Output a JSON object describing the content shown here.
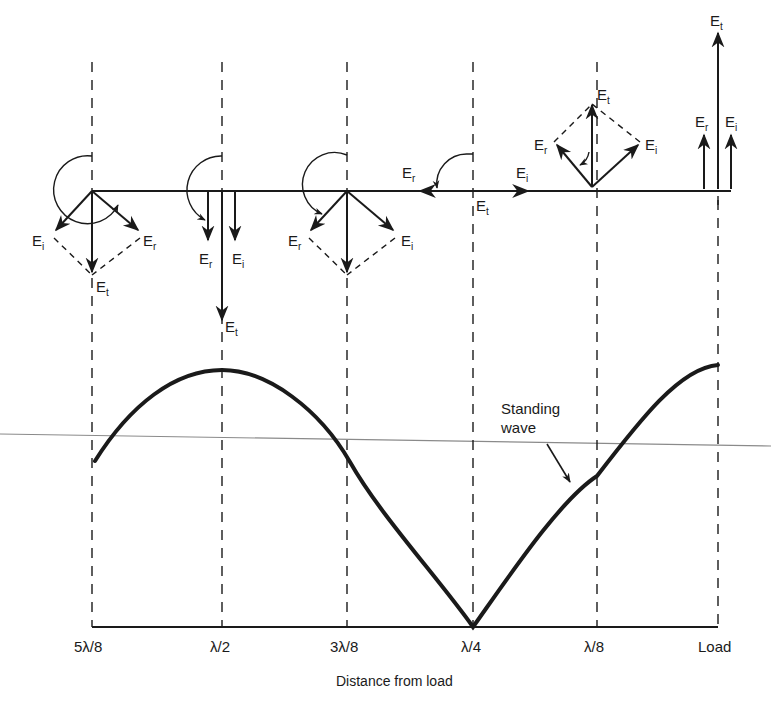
{
  "diagram": {
    "colors": {
      "ink": "#1a1a1a",
      "guide": "#8a8a8a",
      "background": "#ffffff"
    },
    "vector_labels": {
      "incident": "E",
      "incident_sub": "i",
      "reflected": "E",
      "reflected_sub": "r",
      "total": "E",
      "total_sub": "t"
    },
    "positions": [
      {
        "label": "5λ/8",
        "total_direction": "down"
      },
      {
        "label": "λ/2",
        "total_direction": "down (max)"
      },
      {
        "label": "3λ/8",
        "total_direction": "down"
      },
      {
        "label": "λ/4",
        "total_direction": "zero (min)"
      },
      {
        "label": "λ/8",
        "total_direction": "up"
      },
      {
        "label": "Load",
        "total_direction": "up (max)"
      }
    ],
    "curve_label_line1": "Standing",
    "curve_label_line2": "wave",
    "x_axis_title": "Distance from load"
  }
}
